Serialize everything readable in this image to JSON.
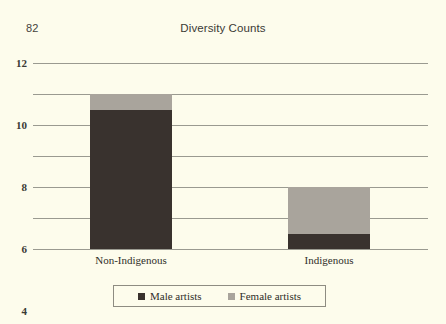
{
  "page": {
    "folio": "82",
    "background_color": "#fdfcec"
  },
  "chart_data": {
    "type": "bar",
    "subtype": "stacked-vertical",
    "title": "Diversity Counts",
    "subtitle": "",
    "xlabel": "",
    "ylabel": "",
    "categories": [
      "Non-Indigenous",
      "Indigenous"
    ],
    "series": [
      {
        "name": "Male artists",
        "color": "#39322e",
        "values": [
          9,
          1
        ]
      },
      {
        "name": "Female artists",
        "color": "#a9a49c",
        "values": [
          1,
          3
        ]
      }
    ],
    "totals": [
      10,
      4
    ],
    "ylim": [
      0,
      12
    ],
    "yticks": [
      0,
      2,
      4,
      6,
      8,
      10,
      12
    ],
    "ytick_labels": [
      "0",
      "2",
      "4",
      "6",
      "8",
      "10",
      "12"
    ],
    "grid": true,
    "grid_axis": "y",
    "grid_color": "#9a9a90",
    "legend_position": "bottom-center",
    "legend_entries": [
      "Male artists",
      "Female artists"
    ]
  }
}
